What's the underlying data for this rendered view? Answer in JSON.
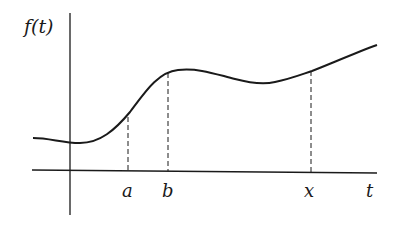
{
  "diagram": {
    "y_axis_label": "f(t)",
    "x_axis_label": "t",
    "marks": [
      {
        "id": "a",
        "label": "a"
      },
      {
        "id": "b",
        "label": "b"
      },
      {
        "id": "x",
        "label": "x"
      }
    ],
    "colors": {
      "ink": "#1a1a1a",
      "background": "#ffffff"
    }
  }
}
